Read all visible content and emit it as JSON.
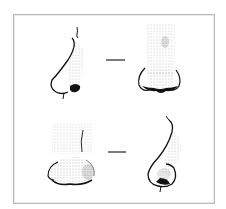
{
  "figure": {
    "layout": "2x2 grid with dash connectors",
    "rows": [
      {
        "left": {
          "view": "profile",
          "description": "side view nose, straight bridge"
        },
        "connector": "—",
        "right": {
          "view": "frontal",
          "description": "front view nose, narrow bridge"
        }
      },
      {
        "left": {
          "view": "frontal",
          "description": "front view nose, wide bulbous tip"
        },
        "connector": "—",
        "right": {
          "view": "profile",
          "description": "side view nose, rounded bulbous tip"
        }
      }
    ],
    "colors": {
      "ink": "#111111",
      "stipple": "#777777",
      "border": "#b9b9b9",
      "background": "#ffffff"
    }
  }
}
